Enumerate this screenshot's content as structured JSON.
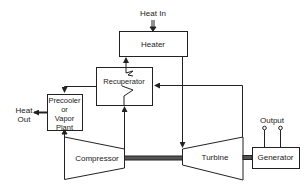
{
  "diagram": {
    "type": "closed-cycle gas turbine schematic",
    "components": {
      "heater": {
        "label": "Heater"
      },
      "recuperator": {
        "label": "Recuperator"
      },
      "precooler": {
        "label_lines": [
          "Precooler",
          "or",
          "Vapor",
          "Plant"
        ]
      },
      "compressor": {
        "label": "Compressor"
      },
      "turbine": {
        "label": "Turbine"
      },
      "generator": {
        "label": "Generator"
      }
    },
    "annotations": {
      "heat_in": "Heat In",
      "heat_out_lines": [
        "Heat",
        "Out"
      ],
      "output": "Output"
    },
    "colors": {
      "line": "#222222",
      "background": "#ffffff"
    },
    "flows": [
      {
        "from": "heat_in",
        "to": "heater"
      },
      {
        "from": "heater",
        "to": "turbine"
      },
      {
        "from": "turbine",
        "to": "recuperator"
      },
      {
        "from": "recuperator",
        "to": "precooler"
      },
      {
        "from": "precooler",
        "to": "heat_out"
      },
      {
        "from": "precooler",
        "to": "compressor"
      },
      {
        "from": "compressor",
        "to": "recuperator"
      },
      {
        "from": "recuperator",
        "to": "heater"
      },
      {
        "from": "compressor",
        "to": "turbine",
        "kind": "shaft"
      },
      {
        "from": "turbine",
        "to": "generator",
        "kind": "shaft"
      },
      {
        "from": "generator",
        "to": "output"
      }
    ]
  }
}
